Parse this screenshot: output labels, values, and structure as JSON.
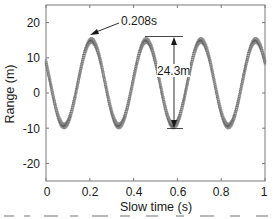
{
  "chart_data": {
    "type": "scatter",
    "title": "",
    "xlabel": "Slow time (s)",
    "ylabel": "Range (m)",
    "xlim": [
      0,
      1
    ],
    "ylim": [
      -25,
      25
    ],
    "xticks": [
      0,
      0.2,
      0.4,
      0.6,
      0.8,
      1
    ],
    "xtick_labels": [
      "0",
      "0.2",
      "0.4",
      "0.6",
      "0.8",
      "1"
    ],
    "yticks": [
      20,
      10,
      0,
      -10,
      -20
    ],
    "ytick_labels": [
      "20",
      "10",
      "0",
      "-10",
      "-20"
    ],
    "grid": false,
    "legend": null,
    "series": [
      {
        "name": "range trajectory",
        "style": "dense gray markers (sinusoid)",
        "color": "#8a8a8a",
        "model": {
          "offset": 2.75,
          "amplitude": 12.15,
          "period": 0.25,
          "peak_time": 0.208
        },
        "x": [
          0.0,
          0.021,
          0.042,
          0.063,
          0.083,
          0.104,
          0.125,
          0.146,
          0.167,
          0.188,
          0.208,
          0.229,
          0.25,
          0.271,
          0.292,
          0.313,
          0.333,
          0.354,
          0.375,
          0.396,
          0.417,
          0.438,
          0.458,
          0.479,
          0.5,
          0.521,
          0.542,
          0.563,
          0.583,
          0.604,
          0.625,
          0.646,
          0.667,
          0.688,
          0.708,
          0.729,
          0.75,
          0.771,
          0.792,
          0.813,
          0.833,
          0.854,
          0.875,
          0.896,
          0.917,
          0.938,
          0.958,
          0.979,
          1.0
        ],
        "y": [
          8.7,
          2.5,
          -3.6,
          -8.1,
          -9.4,
          -7.8,
          -3.3,
          2.9,
          8.9,
          13.3,
          14.9,
          13.3,
          8.9,
          2.7,
          -3.4,
          -7.9,
          -9.4,
          -7.9,
          -3.4,
          2.7,
          8.8,
          13.3,
          14.9,
          13.3,
          8.8,
          2.8,
          -3.4,
          -7.9,
          -9.4,
          -7.9,
          -3.4,
          2.8,
          8.8,
          13.3,
          14.9,
          13.3,
          8.8,
          2.7,
          -3.4,
          -7.9,
          -9.4,
          -7.8,
          -3.3,
          2.9,
          8.9,
          13.3,
          14.9,
          13.3,
          8.7
        ]
      }
    ],
    "annotations": [
      {
        "text": "0.208s",
        "type": "arrow",
        "points_to": {
          "x": 0.208,
          "y": 16
        }
      },
      {
        "text": "24.3m",
        "type": "double-arrow",
        "from": {
          "x": 0.58,
          "y": 15
        },
        "to": {
          "x": 0.58,
          "y": -9.3
        }
      }
    ]
  },
  "axes": {
    "xlabel": "Slow time (s)",
    "ylabel": "Range (m)",
    "xtick_labels": [
      "0",
      "0.2",
      "0.4",
      "0.6",
      "0.8",
      "1"
    ],
    "ytick_labels": [
      "20",
      "10",
      "0",
      "-10",
      "-20"
    ]
  },
  "annotations": {
    "peak_time_label": "0.208s",
    "amplitude_label": "24.3m"
  },
  "colors": {
    "axis": "#7a7a7a",
    "marker": "#8a8a8a",
    "marker_dark": "#5a5a5a",
    "text": "#1a1a1a"
  }
}
